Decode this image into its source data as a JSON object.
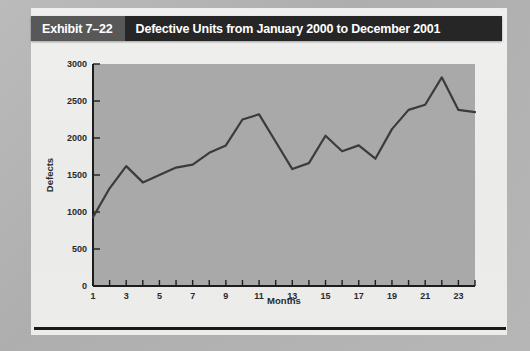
{
  "header": {
    "exhibit_number": "Exhibit 7–22",
    "exhibit_title": "Defective Units from January 2000 to December 2001"
  },
  "chart_data": {
    "type": "line",
    "title": "Defective Units from January 2000 to December 2001",
    "xlabel": "Months",
    "ylabel": "Defects",
    "xlim": [
      1,
      24
    ],
    "ylim": [
      0,
      3000
    ],
    "ytick_values": [
      0,
      500,
      1000,
      1500,
      2000,
      2500,
      3000
    ],
    "ytick_labels": [
      "0",
      "500",
      "1000",
      "1500",
      "2000",
      "2500",
      "3000"
    ],
    "xtick_values": [
      1,
      3,
      5,
      7,
      9,
      11,
      13,
      15,
      17,
      19,
      21,
      23
    ],
    "xtick_labels": [
      "1",
      "3",
      "5",
      "7",
      "9",
      "11",
      "13",
      "15",
      "17",
      "19",
      "21",
      "23"
    ],
    "grid": false,
    "legend": "none",
    "series": [
      {
        "name": "Defects",
        "x": [
          1,
          2,
          3,
          4,
          5,
          6,
          7,
          8,
          9,
          10,
          11,
          12,
          13,
          14,
          15,
          16,
          17,
          18,
          19,
          20,
          21,
          22,
          23,
          24
        ],
        "values": [
          930,
          1320,
          1620,
          1400,
          1500,
          1600,
          1640,
          1800,
          1900,
          2250,
          2320,
          1950,
          1580,
          1660,
          2030,
          1820,
          1900,
          1720,
          2120,
          2380,
          2450,
          2820,
          2380,
          2350
        ]
      }
    ],
    "line_color": "#3b3b3b",
    "plot_bg_color": "#a9a9a9"
  },
  "axis_labels": {
    "x_axis_title": "Months",
    "y_axis_title": "Defects"
  }
}
